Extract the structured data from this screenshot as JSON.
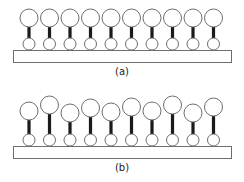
{
  "colors": {
    "outline": "#6e6e6e",
    "stick": "#1a1a1a",
    "fill": "#ffffff"
  },
  "panels": [
    {
      "id": "a",
      "label": "(a)",
      "description": "ordered monolayer, uniform heights",
      "substrate": {
        "x": 13,
        "y": 50,
        "width": 218,
        "height": 12
      },
      "label_y": 66,
      "units": [
        {
          "x": 29,
          "head_cy": 18,
          "anchor_cy": 44
        },
        {
          "x": 49.5,
          "head_cy": 18,
          "anchor_cy": 44
        },
        {
          "x": 70,
          "head_cy": 18,
          "anchor_cy": 44
        },
        {
          "x": 90.5,
          "head_cy": 18,
          "anchor_cy": 44
        },
        {
          "x": 111,
          "head_cy": 18,
          "anchor_cy": 44
        },
        {
          "x": 131.5,
          "head_cy": 18,
          "anchor_cy": 44
        },
        {
          "x": 152,
          "head_cy": 18,
          "anchor_cy": 44
        },
        {
          "x": 172.5,
          "head_cy": 18,
          "anchor_cy": 44
        },
        {
          "x": 193,
          "head_cy": 18,
          "anchor_cy": 44
        },
        {
          "x": 213.5,
          "head_cy": 18,
          "anchor_cy": 44
        }
      ]
    },
    {
      "id": "b",
      "label": "(b)",
      "description": "disordered monolayer, varying heights",
      "substrate": {
        "x": 13,
        "y": 146,
        "width": 218,
        "height": 12
      },
      "label_y": 162,
      "units": [
        {
          "x": 29,
          "head_cy": 111,
          "anchor_cy": 140
        },
        {
          "x": 49.5,
          "head_cy": 105,
          "anchor_cy": 140
        },
        {
          "x": 70,
          "head_cy": 113,
          "anchor_cy": 140
        },
        {
          "x": 90.5,
          "head_cy": 108,
          "anchor_cy": 140
        },
        {
          "x": 111,
          "head_cy": 112,
          "anchor_cy": 140
        },
        {
          "x": 131.5,
          "head_cy": 107,
          "anchor_cy": 140
        },
        {
          "x": 152,
          "head_cy": 111,
          "anchor_cy": 140
        },
        {
          "x": 172.5,
          "head_cy": 105,
          "anchor_cy": 140
        },
        {
          "x": 193,
          "head_cy": 113,
          "anchor_cy": 140
        },
        {
          "x": 213.5,
          "head_cy": 107,
          "anchor_cy": 140
        }
      ]
    }
  ],
  "geometry": {
    "head_r": 9,
    "anchor_r": 6,
    "stick_w": 3.2
  }
}
